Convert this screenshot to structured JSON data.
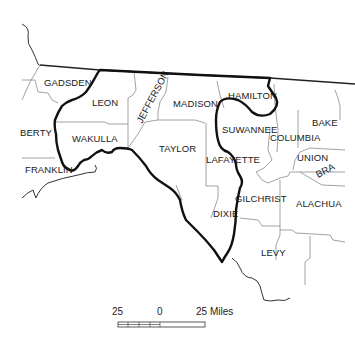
{
  "map": {
    "counties": [
      {
        "name": "GADSDEN",
        "x": 44,
        "y": 86
      },
      {
        "name": "LEON",
        "x": 92,
        "y": 106
      },
      {
        "name": "JEFFERSON",
        "x": 142,
        "y": 110,
        "rotate": -62
      },
      {
        "name": "MADISON",
        "x": 173,
        "y": 107
      },
      {
        "name": "HAMILTON",
        "x": 228,
        "y": 99
      },
      {
        "name": "BERTY",
        "x": 20,
        "y": 136
      },
      {
        "name": "WAKULLA",
        "x": 72,
        "y": 142
      },
      {
        "name": "TAYLOR",
        "x": 159,
        "y": 152
      },
      {
        "name": "SUWANNEE",
        "x": 222,
        "y": 133
      },
      {
        "name": "COLUMBIA",
        "x": 270,
        "y": 141
      },
      {
        "name": "BAKE",
        "x": 312,
        "y": 126
      },
      {
        "name": "LAFAYETTE",
        "x": 206,
        "y": 163
      },
      {
        "name": "UNION",
        "x": 297,
        "y": 161
      },
      {
        "name": "BRA",
        "x": 318,
        "y": 176,
        "rotate": -28
      },
      {
        "name": "FRANKLIN",
        "x": 25,
        "y": 173
      },
      {
        "name": "GILCHRIST",
        "x": 235,
        "y": 202
      },
      {
        "name": "ALACHUA",
        "x": 296,
        "y": 207
      },
      {
        "name": "DIXIE",
        "x": 213,
        "y": 217
      },
      {
        "name": "LEVY",
        "x": 261,
        "y": 256
      }
    ],
    "scale_bar": {
      "left_label": "25",
      "center_label": "0",
      "right_label": "25 Miles"
    }
  },
  "colors": {
    "background": "#ffffff",
    "county_border": "#8a8a8a",
    "region_border": "#111111",
    "text": "#1a1a1a"
  }
}
